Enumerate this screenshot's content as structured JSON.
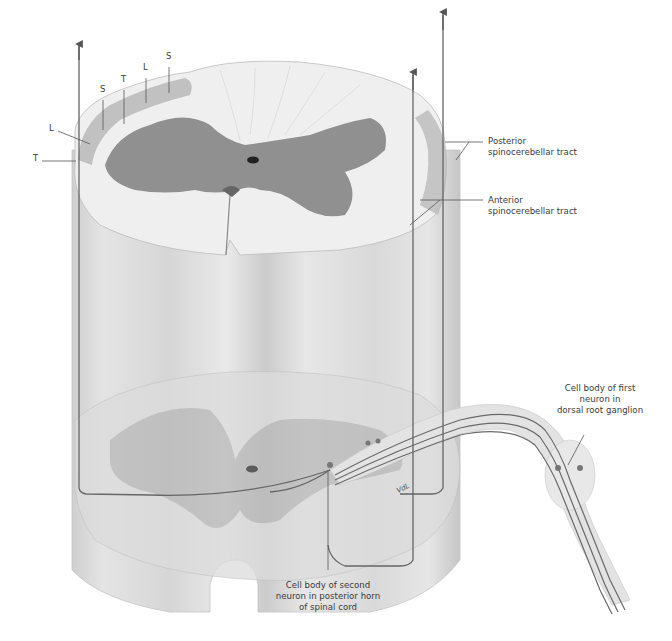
{
  "figure": {
    "colors": {
      "background": "#ffffff",
      "white_matter_light": "#f2f2f2",
      "white_matter_mid": "#e2e2e2",
      "gray_matter": "#8e8e8e",
      "column_shade": "#d4d4d4",
      "tract_band": "#b9b9b9",
      "pathway_line": "#666666",
      "label_line": "#555555"
    },
    "somatotopic_labels": [
      {
        "text": "T",
        "x": 33,
        "y": 158
      },
      {
        "text": "L",
        "x": 50,
        "y": 128
      },
      {
        "text": "S",
        "x": 101,
        "y": 88
      },
      {
        "text": "T",
        "x": 122,
        "y": 78
      },
      {
        "text": "L",
        "x": 145,
        "y": 66
      },
      {
        "text": "S",
        "x": 167,
        "y": 55
      }
    ],
    "tract_labels": {
      "posterior": {
        "line1": "Posterior",
        "line2": "spinocerebellar tract"
      },
      "anterior": {
        "line1": "Anterior",
        "line2": "spinocerebellar tract"
      }
    },
    "cell_labels": {
      "first_neuron": {
        "line1": "Cell body of first",
        "line2": "neuron in",
        "line3": "dorsal root ganglion"
      },
      "second_neuron": {
        "line1": "Cell body of second",
        "line2": "neuron in posterior horn",
        "line3": "of spinal cord"
      }
    },
    "signature": "VdL"
  }
}
